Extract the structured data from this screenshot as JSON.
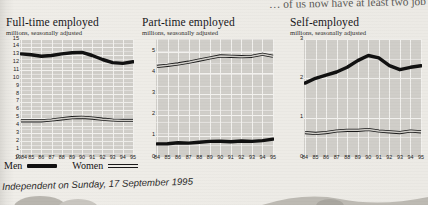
{
  "headline": {
    "partial_text": "… of us now have at least two job"
  },
  "legend": {
    "men_label": "Men",
    "women_label": "Women"
  },
  "source": {
    "text": "Independent on Sunday, 17 September 1995"
  },
  "chart_data": [
    {
      "type": "line",
      "title": "Full-time employed",
      "subtitle": "millions, seasonally adjusted",
      "xlabel": "",
      "ylabel": "",
      "ylim": [
        0,
        15
      ],
      "yticks": [
        "15",
        "14",
        "13",
        "12",
        "11",
        "10",
        "9",
        "8",
        "7",
        "6",
        "5",
        "4",
        "3",
        "2",
        "1",
        "0"
      ],
      "x": [
        1984,
        1985,
        1986,
        1987,
        1988,
        1989,
        1990,
        1991,
        1992,
        1993,
        1994,
        1995
      ],
      "xticklabels": [
        "1984",
        "85",
        "86",
        "87",
        "88",
        "89",
        "90",
        "91",
        "92",
        "93",
        "94",
        "95"
      ],
      "grid": true,
      "legend_position": "below-figure",
      "series": [
        {
          "name": "Men",
          "values": [
            13.1,
            13.0,
            12.8,
            12.9,
            13.1,
            13.25,
            13.3,
            12.9,
            12.4,
            12.0,
            11.9,
            12.1
          ]
        },
        {
          "name": "Women",
          "values": [
            4.6,
            4.6,
            4.6,
            4.7,
            4.85,
            5.0,
            5.05,
            4.95,
            4.8,
            4.7,
            4.65,
            4.65
          ]
        }
      ]
    },
    {
      "type": "line",
      "title": "Part-time employed",
      "subtitle": "millions, seasonally adjusted",
      "xlabel": "",
      "ylabel": "",
      "ylim": [
        0,
        5.6
      ],
      "yticks": [
        "5",
        "4",
        "3",
        "2",
        "1",
        "0"
      ],
      "x": [
        1984,
        1985,
        1986,
        1987,
        1988,
        1989,
        1990,
        1991,
        1992,
        1993,
        1994,
        1995
      ],
      "xticklabels": [
        "84",
        "85",
        "86",
        "87",
        "88",
        "89",
        "90",
        "91",
        "92",
        "93",
        "94",
        "95"
      ],
      "grid": true,
      "legend_position": "below-figure",
      "series": [
        {
          "name": "Men",
          "values": [
            0.62,
            0.63,
            0.68,
            0.66,
            0.7,
            0.74,
            0.75,
            0.72,
            0.76,
            0.74,
            0.78,
            0.85
          ]
        },
        {
          "name": "Women",
          "values": [
            4.3,
            4.35,
            4.42,
            4.5,
            4.6,
            4.7,
            4.8,
            4.78,
            4.76,
            4.78,
            4.88,
            4.78
          ]
        }
      ]
    },
    {
      "type": "line",
      "title": "Self-employed",
      "subtitle": "millions, seasonally adjusted",
      "xlabel": "",
      "ylabel": "",
      "ylim": [
        0,
        3
      ],
      "yticks": [
        "3",
        "2",
        "1",
        "0"
      ],
      "x": [
        1984,
        1985,
        1986,
        1987,
        1988,
        1989,
        1990,
        1991,
        1992,
        1993,
        1994,
        1995
      ],
      "xticklabels": [
        "84",
        "85",
        "86",
        "87",
        "88",
        "89",
        "90",
        "91",
        "92",
        "93",
        "94",
        "95"
      ],
      "grid": true,
      "legend_position": "below-figure",
      "series": [
        {
          "name": "Men",
          "values": [
            1.88,
            2.0,
            2.08,
            2.16,
            2.28,
            2.45,
            2.58,
            2.52,
            2.32,
            2.22,
            2.28,
            2.32
          ]
        },
        {
          "name": "Women",
          "values": [
            0.62,
            0.6,
            0.62,
            0.66,
            0.68,
            0.68,
            0.7,
            0.66,
            0.64,
            0.62,
            0.66,
            0.64
          ]
        }
      ]
    }
  ]
}
